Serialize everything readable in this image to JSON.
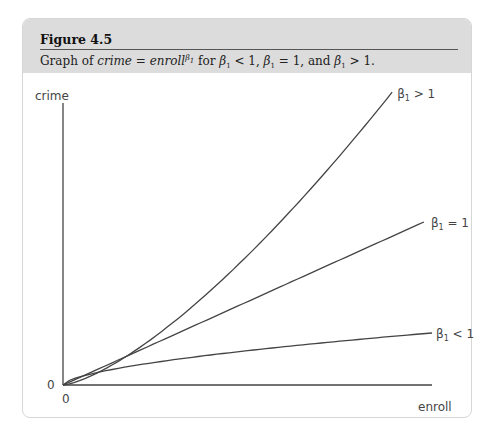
{
  "figure": {
    "number": "Figure 4.5",
    "caption": {
      "prefix": "Graph of ",
      "lhs": "crime",
      "equals": " = ",
      "rhs": "enroll",
      "exponent": "β",
      "exponent_sub": "1",
      "middle": " for ",
      "cond1": "β",
      "cond1_sub": "1",
      "cond1_rel": " < 1, ",
      "cond2": "β",
      "cond2_sub": "1",
      "cond2_rel": " = 1, and ",
      "cond3": "β",
      "cond3_sub": "1",
      "cond3_rel": " > 1."
    }
  },
  "chart_data": {
    "type": "line",
    "xlabel": "enroll",
    "ylabel": "crime",
    "x_tick_labels": [
      "0"
    ],
    "y_tick_labels": [
      "0"
    ],
    "xlim": [
      0,
      1
    ],
    "ylim": [
      0,
      1
    ],
    "grid": false,
    "legend": "inline-labels-at-line-ends",
    "series": [
      {
        "name": "β₁ > 1",
        "label_main": "β",
        "label_sub": "1",
        "label_rel": " > 1",
        "exponent": 1.41,
        "scale": 1.17,
        "x_end": 0.892,
        "x": [
          0,
          0.1,
          0.2,
          0.3,
          0.4,
          0.5,
          0.6,
          0.7,
          0.8,
          0.892
        ],
        "y": [
          0,
          0.046,
          0.121,
          0.214,
          0.321,
          0.441,
          0.57,
          0.709,
          0.855,
          1.0
        ]
      },
      {
        "name": "β₁ = 1",
        "label_main": "β",
        "label_sub": "1",
        "label_rel": " = 1",
        "exponent": 1.0,
        "scale": 0.567,
        "x_end": 0.978,
        "x": [
          0,
          0.2,
          0.4,
          0.6,
          0.8,
          0.978
        ],
        "y": [
          0,
          0.113,
          0.227,
          0.34,
          0.454,
          0.554
        ]
      },
      {
        "name": "β₁ < 1",
        "label_main": "β",
        "label_sub": "1",
        "label_rel": " < 1",
        "exponent": 0.6,
        "scale": 0.177,
        "x_end": 1.0,
        "x": [
          0,
          0.05,
          0.1,
          0.2,
          0.3,
          0.4,
          0.5,
          0.6,
          0.7,
          0.8,
          0.9,
          1.0
        ],
        "y": [
          0,
          0.029,
          0.045,
          0.07,
          0.086,
          0.102,
          0.118,
          0.135,
          0.152,
          0.163,
          0.171,
          0.177
        ]
      }
    ]
  }
}
